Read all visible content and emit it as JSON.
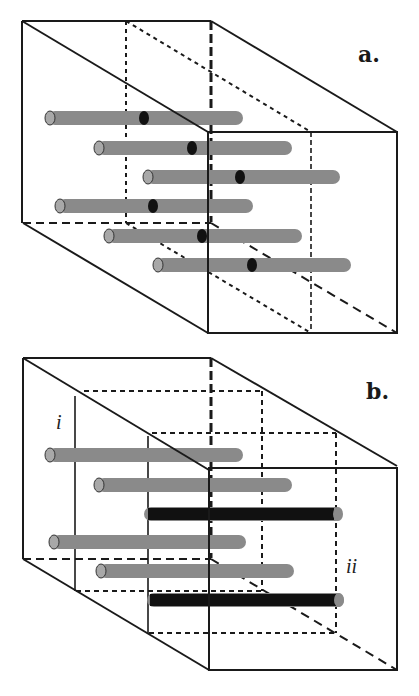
{
  "figure": {
    "panels": [
      {
        "id": "a",
        "label": "a.",
        "description": "Box with six grey rods, each carrying one black marker",
        "rods": [
          {
            "x1": 48,
            "x2": 243,
            "y": 118,
            "marker_x": 144,
            "marker": true
          },
          {
            "x1": 97,
            "x2": 292,
            "y": 148,
            "marker_x": 192,
            "marker": true
          },
          {
            "x1": 146,
            "x2": 340,
            "y": 177,
            "marker_x": 240,
            "marker": true
          },
          {
            "x1": 58,
            "x2": 253,
            "y": 206,
            "marker_x": 153,
            "marker": true
          },
          {
            "x1": 107,
            "x2": 302,
            "y": 236,
            "marker_x": 202,
            "marker": true
          },
          {
            "x1": 156,
            "x2": 351,
            "y": 265,
            "marker_x": 252,
            "marker": true
          }
        ]
      },
      {
        "id": "b",
        "label": "b.",
        "description": "Box with four grey rods and two black rods; two dashed sub-volumes labelled i and ii",
        "sublabels": [
          "i",
          "ii"
        ],
        "rods": [
          {
            "x1": 48,
            "x2": 243,
            "y": 107,
            "color": "grey"
          },
          {
            "x1": 97,
            "x2": 292,
            "y": 137,
            "color": "grey"
          },
          {
            "x1": 146,
            "x2": 340,
            "y": 166,
            "color": "black"
          },
          {
            "x1": 52,
            "x2": 246,
            "y": 194,
            "color": "grey"
          },
          {
            "x1": 99,
            "x2": 294,
            "y": 223,
            "color": "grey"
          },
          {
            "x1": 150,
            "x2": 341,
            "y": 252,
            "color": "black"
          }
        ]
      }
    ],
    "colors": {
      "line": "#1a1a1a",
      "rod_grey": "#8a8a8a",
      "rod_cap": "#a8a8a8",
      "rod_black": "#111111",
      "background": "#ffffff"
    }
  }
}
